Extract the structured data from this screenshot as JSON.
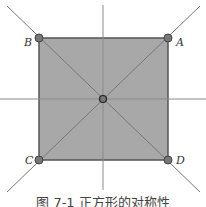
{
  "diagram": {
    "caption": "图 7-1   正方形的对称性",
    "labels": {
      "A": "A",
      "B": "B",
      "C": "C",
      "D": "D"
    },
    "colors": {
      "fill": "#a8a8a8",
      "stroke": "#555555",
      "axis": "#888888",
      "vertex": "#777777"
    }
  }
}
